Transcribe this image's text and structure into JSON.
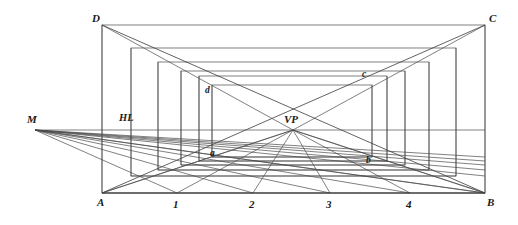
{
  "figure": {
    "width": 518,
    "height": 225,
    "background_color": "#ffffff",
    "line_color": "#4a4a4a",
    "line_color_strong": "#3a3a3a",
    "label_color": "#1a1a1a"
  },
  "chart_data": {
    "type": "diagram",
    "points": {
      "A": {
        "x": 102,
        "y": 193,
        "label": "A",
        "label_x": 97,
        "label_y": 206
      },
      "B": {
        "x": 485,
        "y": 193,
        "label": "B",
        "label_x": 487,
        "label_y": 206
      },
      "C": {
        "x": 485,
        "y": 25,
        "label": "C",
        "label_x": 489,
        "label_y": 22
      },
      "D": {
        "x": 102,
        "y": 25,
        "label": "D",
        "label_x": 92,
        "label_y": 22
      },
      "VP": {
        "x": 293,
        "y": 130,
        "label": "VP",
        "label_x": 284,
        "label_y": 123
      },
      "M": {
        "x": 35,
        "y": 130,
        "label": "M",
        "label_x": 27,
        "label_y": 123
      },
      "a": {
        "x": 212,
        "y": 157,
        "label": "a",
        "label_x": 210,
        "label_y": 156
      },
      "b": {
        "x": 372,
        "y": 163,
        "label": "b",
        "label_x": 366,
        "label_y": 163
      },
      "c": {
        "x": 372,
        "y": 78,
        "label": "c",
        "label_x": 362,
        "label_y": 77
      },
      "d": {
        "x": 212,
        "y": 85,
        "label": "d",
        "label_x": 205,
        "label_y": 93
      }
    },
    "horizon_line": {
      "label": "HL",
      "y": 130,
      "x_start": 35,
      "x_end": 485,
      "label_x": 119,
      "label_y": 121
    },
    "baseline": {
      "y": 193,
      "x_start": 102,
      "x_end": 485
    },
    "baseline_divisions": [
      {
        "label": "1",
        "x": 177,
        "label_x": 173,
        "label_y": 208
      },
      {
        "label": "2",
        "x": 253,
        "label_x": 249,
        "label_y": 208
      },
      {
        "label": "3",
        "x": 330,
        "label_x": 326,
        "label_y": 208
      },
      {
        "label": "4",
        "x": 410,
        "label_x": 406,
        "label_y": 208
      }
    ],
    "nested_rectangles": [
      {
        "name": "outer-ABCD",
        "left": 102,
        "right": 485,
        "top": 25,
        "bottom": 193
      },
      {
        "name": "ring-1",
        "left": 131,
        "right": 456,
        "top": 48,
        "bottom": 176
      },
      {
        "name": "ring-2",
        "left": 158,
        "right": 429,
        "top": 62,
        "bottom": 170
      },
      {
        "name": "ring-3",
        "left": 181,
        "right": 405,
        "top": 71,
        "bottom": 165
      },
      {
        "name": "ring-4",
        "left": 199,
        "right": 387,
        "top": 76,
        "bottom": 161
      },
      {
        "name": "ring-5-abcd",
        "left": 212,
        "right": 372,
        "top": 85,
        "bottom": 157
      }
    ],
    "vp_rays_to_baseline": [
      102,
      177,
      253,
      330,
      410,
      485
    ],
    "m_rays_to_baseline": [
      177,
      253,
      330,
      410,
      485
    ],
    "diagonals": [
      {
        "name": "diag-D-to-B",
        "from": "D",
        "to": "B"
      },
      {
        "name": "diag-C-to-A",
        "from": "C",
        "to": "A"
      }
    ],
    "vertical_posts": [
      131,
      158,
      181,
      199,
      212,
      372,
      387,
      405,
      429,
      456
    ]
  },
  "labels": {
    "A": "A",
    "B": "B",
    "C": "C",
    "D": "D",
    "a": "a",
    "b": "b",
    "c": "c",
    "d": "d",
    "VP": "VP",
    "M": "M",
    "HL": "HL",
    "n1": "1",
    "n2": "2",
    "n3": "3",
    "n4": "4"
  }
}
